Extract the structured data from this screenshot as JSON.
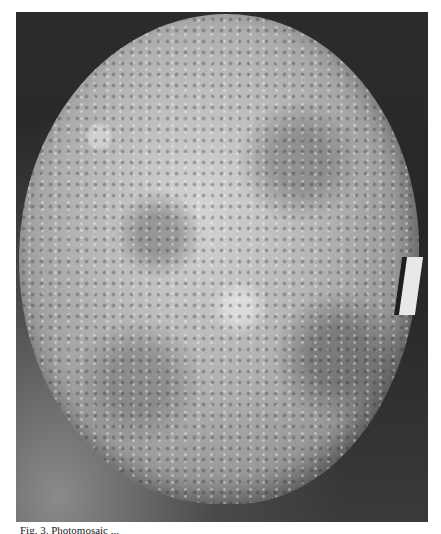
{
  "image": {
    "subject": "Photomosaic of a cratered planetary surface (Mercury-like) against a dark background",
    "colors": {
      "background_page": "#ffffff",
      "space": "#2c2c2c",
      "surface_light": "#d4d4d4",
      "surface_dark": "#5a5a5a"
    }
  },
  "caption": {
    "text": "Fig. 3. Photomosaic ..."
  }
}
